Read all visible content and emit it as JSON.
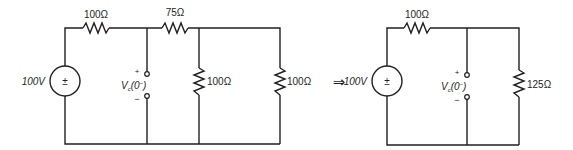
{
  "diagram": {
    "type": "circuit-equivalence",
    "arrow_symbol": "⇒",
    "left_circuit": {
      "source": {
        "label": "100V",
        "symbol": "±"
      },
      "resistors": [
        {
          "id": "R1",
          "label": "100Ω",
          "orientation": "horizontal",
          "position": "top-left"
        },
        {
          "id": "R2",
          "label": "75Ω",
          "orientation": "horizontal",
          "position": "top-middle"
        },
        {
          "id": "R3",
          "label": "100Ω",
          "orientation": "vertical",
          "position": "middle"
        },
        {
          "id": "R4",
          "label": "100Ω",
          "orientation": "vertical",
          "position": "right"
        }
      ],
      "terminals": {
        "plus": "+",
        "minus": "−",
        "label_main": "V",
        "label_sub": "c",
        "label_arg": "(0",
        "label_sup": "−",
        "label_close": ")"
      }
    },
    "right_circuit": {
      "source": {
        "label": "100V",
        "symbol": "±"
      },
      "resistors": [
        {
          "id": "R1",
          "label": "100Ω",
          "orientation": "horizontal",
          "position": "top-left"
        },
        {
          "id": "Req",
          "label": "125Ω",
          "orientation": "vertical",
          "position": "right"
        }
      ],
      "terminals": {
        "plus": "+",
        "minus": "−",
        "label_main": "V",
        "label_sub": "c",
        "label_arg": "(0",
        "label_sup": "−",
        "label_close": ")"
      }
    }
  }
}
